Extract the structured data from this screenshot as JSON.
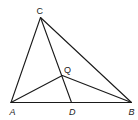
{
  "diagram": {
    "type": "triangle-geometry",
    "points": {
      "A": {
        "label": "A",
        "x": 11,
        "y": 102.5
      },
      "B": {
        "label": "B",
        "x": 131.5,
        "y": 102.5
      },
      "C": {
        "label": "C",
        "x": 40.5,
        "y": 17.5
      },
      "D": {
        "label": "D",
        "x": 71.5,
        "y": 102.5
      },
      "Q": {
        "label": "Q",
        "x": 62.3,
        "y": 75.5
      }
    },
    "segments": [
      [
        "A",
        "B"
      ],
      [
        "A",
        "C"
      ],
      [
        "C",
        "B"
      ],
      [
        "C",
        "D"
      ],
      [
        "A",
        "Q"
      ],
      [
        "Q",
        "B"
      ]
    ],
    "labels": {
      "A": "A",
      "B": "B",
      "C": "C",
      "D": "D",
      "Q": "Q"
    },
    "colors": {
      "stroke": "#1a1a1a",
      "text": "#222222",
      "background": "#ffffff"
    }
  }
}
